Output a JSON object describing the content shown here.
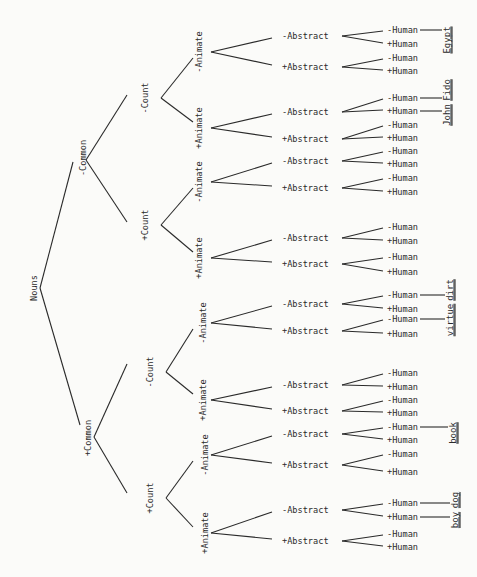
{
  "root": {
    "label": "Nouns",
    "x": 34,
    "y": 288
  },
  "levels": {
    "common": [
      {
        "label": "-Common",
        "x": 83,
        "y": 158
      },
      {
        "label": "+Common",
        "x": 88,
        "y": 438
      }
    ],
    "count": [
      {
        "label": "-Count",
        "x": 145,
        "y": 98,
        "parent": 0
      },
      {
        "label": "+Count",
        "x": 145,
        "y": 225,
        "parent": 0
      },
      {
        "label": "-Count",
        "x": 150,
        "y": 372,
        "parent": 1
      },
      {
        "label": "+Count",
        "x": 150,
        "y": 498,
        "parent": 1
      }
    ],
    "animate": [
      {
        "label": "-Animate",
        "x": 199,
        "y": 52,
        "parent": 0
      },
      {
        "label": "+Animate",
        "x": 199,
        "y": 128,
        "parent": 0
      },
      {
        "label": "-Animate",
        "x": 199,
        "y": 182,
        "parent": 1
      },
      {
        "label": "+Animate",
        "x": 199,
        "y": 258,
        "parent": 1
      },
      {
        "label": "-Animate",
        "x": 203,
        "y": 323,
        "parent": 2
      },
      {
        "label": "+Animate",
        "x": 203,
        "y": 400,
        "parent": 2
      },
      {
        "label": "-Animate",
        "x": 205,
        "y": 455,
        "parent": 3
      },
      {
        "label": "+Animate",
        "x": 205,
        "y": 533,
        "parent": 3
      }
    ],
    "abstract": [
      {
        "label": "-Abstract",
        "y": 36,
        "parent": 0
      },
      {
        "label": "+Abstract",
        "y": 67,
        "parent": 0
      },
      {
        "label": "-Abstract",
        "y": 112,
        "parent": 1
      },
      {
        "label": "+Abstract",
        "y": 139,
        "parent": 1
      },
      {
        "label": "-Abstract",
        "y": 161,
        "parent": 2
      },
      {
        "label": "+Abstract",
        "y": 188,
        "parent": 2
      },
      {
        "label": "-Abstract",
        "y": 238,
        "parent": 3
      },
      {
        "label": "+Abstract",
        "y": 264,
        "parent": 3
      },
      {
        "label": "-Abstract",
        "y": 304,
        "parent": 4
      },
      {
        "label": "+Abstract",
        "y": 331,
        "parent": 4
      },
      {
        "label": "-Abstract",
        "y": 385,
        "parent": 5
      },
      {
        "label": "+Abstract",
        "y": 411,
        "parent": 5
      },
      {
        "label": "-Abstract",
        "y": 434,
        "parent": 6
      },
      {
        "label": "+Abstract",
        "y": 465,
        "parent": 6
      },
      {
        "label": "-Abstract",
        "y": 510,
        "parent": 7
      },
      {
        "label": "+Abstract",
        "y": 541,
        "parent": 7
      }
    ],
    "human": [
      {
        "label": "-Human",
        "y": 30
      },
      {
        "label": "+Human",
        "y": 44
      },
      {
        "label": "-Human",
        "y": 58
      },
      {
        "label": "+Human",
        "y": 71
      },
      {
        "label": "-Human",
        "y": 98
      },
      {
        "label": "+Human",
        "y": 111
      },
      {
        "label": "-Human",
        "y": 125
      },
      {
        "label": "+Human",
        "y": 138
      },
      {
        "label": "-Human",
        "y": 151
      },
      {
        "label": "+Human",
        "y": 164
      },
      {
        "label": "-Human",
        "y": 178
      },
      {
        "label": "+Human",
        "y": 192
      },
      {
        "label": "-Human",
        "y": 227
      },
      {
        "label": "+Human",
        "y": 241
      },
      {
        "label": "-Human",
        "y": 257
      },
      {
        "label": "+Human",
        "y": 272
      },
      {
        "label": "-Human",
        "y": 295
      },
      {
        "label": "+Human",
        "y": 309
      },
      {
        "label": "-Human",
        "y": 319
      },
      {
        "label": "+Human",
        "y": 334
      },
      {
        "label": "-Human",
        "y": 373
      },
      {
        "label": "+Human",
        "y": 387
      },
      {
        "label": "-Human",
        "y": 400
      },
      {
        "label": "+Human",
        "y": 413
      },
      {
        "label": "-Human",
        "y": 427
      },
      {
        "label": "+Human",
        "y": 440
      },
      {
        "label": "-Human",
        "y": 454
      },
      {
        "label": "+Human",
        "y": 472
      },
      {
        "label": "-Human",
        "y": 503
      },
      {
        "label": "+Human",
        "y": 517
      },
      {
        "label": "-Human",
        "y": 534
      },
      {
        "label": "+Human",
        "y": 547
      }
    ]
  },
  "examples": [
    {
      "word": "Egypt",
      "human_index": 0,
      "x": 447,
      "y": 40
    },
    {
      "word": "Fido",
      "human_index": 4,
      "x": 447,
      "y": 90
    },
    {
      "word": "John",
      "human_index": 5,
      "x": 447,
      "y": 115
    },
    {
      "word": "dirt",
      "human_index": 16,
      "x": 450,
      "y": 290
    },
    {
      "word": "virtue",
      "human_index": 18,
      "x": 450,
      "y": 320
    },
    {
      "word": "book",
      "human_index": 24,
      "x": 453,
      "y": 433
    },
    {
      "word": "dog",
      "human_index": 28,
      "x": 455,
      "y": 500
    },
    {
      "word": "boy",
      "human_index": 29,
      "x": 455,
      "y": 520
    }
  ]
}
